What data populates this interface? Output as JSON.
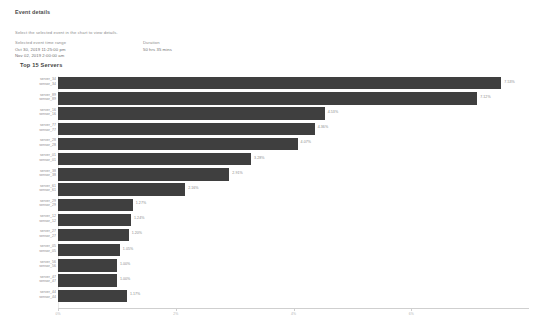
{
  "header": {
    "title": "Event details",
    "hint": "Select the selected event in the chart to view details."
  },
  "meta": {
    "range_label": "Selected event time range",
    "range_start": "Oct 30, 2019 11:25:00 pm",
    "range_end": "Nov 02, 2019 2:00:00 am",
    "duration_label": "Duration",
    "duration_value": "50 hrs 35 mins"
  },
  "chart_data": {
    "type": "bar",
    "orientation": "horizontal",
    "title": "Top 15 Servers",
    "xlabel": "",
    "ylabel": "",
    "xlim": [
      0,
      8
    ],
    "grid": false,
    "legend": null,
    "axis_ticks": [
      "0%",
      "2%",
      "4%",
      "6%"
    ],
    "axis_tick_values": [
      0,
      2,
      4,
      6
    ],
    "bar_color": "#3f3f3f",
    "categories": [
      "server_34\nsensor_34",
      "server_89\nsensor_89",
      "server_16\nsensor_16",
      "server_77\nsensor_77",
      "server_28\nsensor_28",
      "server_01\nsensor_01",
      "server_38\nsensor_38",
      "server_61\nsensor_61",
      "server_29\nsensor_29",
      "server_12\nsensor_12",
      "server_27\nsensor_27",
      "server_05\nsensor_05",
      "server_56\nsensor_56",
      "server_47\nsensor_47",
      "server_44\nsensor_44"
    ],
    "values": [
      7.53,
      7.12,
      4.53,
      4.36,
      4.07,
      3.28,
      2.91,
      2.16,
      1.27,
      1.24,
      1.2,
      1.05,
      1.0,
      1.0,
      1.17
    ],
    "value_labels": [
      "7.53%",
      "7.12%",
      "4.53%",
      "4.36%",
      "4.07%",
      "3.28%",
      "2.91%",
      "2.16%",
      "1.27%",
      "1.24%",
      "1.20%",
      "1.05%",
      "1.00%",
      "1.00%",
      "1.17%"
    ],
    "rows": [
      {
        "label_line1": "server_34",
        "label_line2": "sensor_34",
        "value": 7.53,
        "value_label": "7.53%"
      },
      {
        "label_line1": "server_89",
        "label_line2": "sensor_89",
        "value": 7.12,
        "value_label": "7.12%"
      },
      {
        "label_line1": "server_16",
        "label_line2": "sensor_16",
        "value": 4.53,
        "value_label": "4.53%"
      },
      {
        "label_line1": "server_77",
        "label_line2": "sensor_77",
        "value": 4.36,
        "value_label": "4.36%"
      },
      {
        "label_line1": "server_28",
        "label_line2": "sensor_28",
        "value": 4.07,
        "value_label": "4.07%"
      },
      {
        "label_line1": "server_01",
        "label_line2": "sensor_01",
        "value": 3.28,
        "value_label": "3.28%"
      },
      {
        "label_line1": "server_38",
        "label_line2": "sensor_38",
        "value": 2.91,
        "value_label": "2.91%"
      },
      {
        "label_line1": "server_61",
        "label_line2": "sensor_61",
        "value": 2.16,
        "value_label": "2.16%"
      },
      {
        "label_line1": "server_29",
        "label_line2": "sensor_29",
        "value": 1.27,
        "value_label": "1.27%"
      },
      {
        "label_line1": "server_12",
        "label_line2": "sensor_12",
        "value": 1.24,
        "value_label": "1.24%"
      },
      {
        "label_line1": "server_27",
        "label_line2": "sensor_27",
        "value": 1.2,
        "value_label": "1.20%"
      },
      {
        "label_line1": "server_05",
        "label_line2": "sensor_05",
        "value": 1.05,
        "value_label": "1.05%"
      },
      {
        "label_line1": "server_56",
        "label_line2": "sensor_56",
        "value": 1.0,
        "value_label": "1.00%"
      },
      {
        "label_line1": "server_47",
        "label_line2": "sensor_47",
        "value": 1.0,
        "value_label": "1.00%"
      },
      {
        "label_line1": "server_44",
        "label_line2": "sensor_44",
        "value": 1.17,
        "value_label": "1.17%"
      }
    ]
  }
}
